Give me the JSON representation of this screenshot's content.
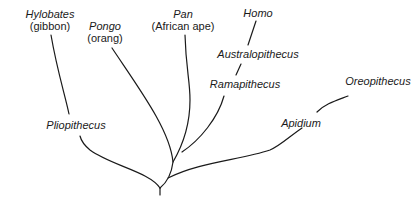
{
  "diagram": {
    "type": "phylogenetic-tree",
    "root": {
      "x": 160,
      "y": 196
    },
    "nodes": [
      {
        "id": "hylobates",
        "genus": "Hylobates",
        "common": "(gibbon)",
        "x": 50,
        "y": 8
      },
      {
        "id": "pongo",
        "genus": "Pongo",
        "common": "(orang)",
        "x": 105,
        "y": 20
      },
      {
        "id": "pan",
        "genus": "Pan",
        "common": "(African ape)",
        "x": 183,
        "y": 8
      },
      {
        "id": "homo",
        "genus": "Homo",
        "common": "",
        "x": 258,
        "y": 7
      },
      {
        "id": "australopithecus",
        "genus": "Australopithecus",
        "common": "",
        "x": 258,
        "y": 48
      },
      {
        "id": "ramapithecus",
        "genus": "Ramapithecus",
        "common": "",
        "x": 245,
        "y": 78
      },
      {
        "id": "oreopithecus",
        "genus": "Oreopithecus",
        "common": "",
        "x": 378,
        "y": 75
      },
      {
        "id": "apidium",
        "genus": "Apidium",
        "common": "",
        "x": 301,
        "y": 117
      },
      {
        "id": "pliopithecus",
        "genus": "Pliopithecus",
        "common": "",
        "x": 76,
        "y": 119
      }
    ],
    "edges": [
      {
        "from": "root",
        "to": "pliopithecus"
      },
      {
        "from": "pliopithecus",
        "to": "hylobates"
      },
      {
        "from": "root",
        "to": "pongo"
      },
      {
        "from": "root",
        "to": "pan"
      },
      {
        "from": "root",
        "to": "ramapithecus"
      },
      {
        "from": "ramapithecus",
        "to": "australopithecus"
      },
      {
        "from": "australopithecus",
        "to": "homo"
      },
      {
        "from": "root",
        "to": "apidium"
      },
      {
        "from": "apidium",
        "to": "oreopithecus"
      }
    ],
    "stroke_color": "#1a1a1a",
    "background": "#ffffff"
  }
}
